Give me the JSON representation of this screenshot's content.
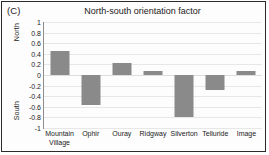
{
  "panel": {
    "label": "(C)"
  },
  "chart_data": {
    "type": "bar",
    "title": "North-south orientation factor",
    "xlabel": "",
    "ylabel": "",
    "categories": [
      "Mountain Village",
      "Ophir",
      "Ouray",
      "Ridgway",
      "Silverton",
      "Telluride",
      "Image"
    ],
    "values": [
      0.46,
      -0.57,
      0.23,
      0.08,
      -0.8,
      -0.28,
      0.07
    ],
    "ylim": [
      -1,
      1
    ],
    "yticks": [
      1,
      0.8,
      0.6,
      0.4,
      0.2,
      0,
      -0.2,
      -0.4,
      -0.6,
      -0.8,
      -1
    ],
    "ytick_labels": [
      "1",
      "0.8",
      "0.6",
      "0.4",
      "0.2",
      "0",
      "-0.2",
      "-0.4",
      "-0.6",
      "-0.8",
      "-1"
    ],
    "axis_direction_labels": {
      "positive": "North",
      "negative": "South"
    },
    "grid": true,
    "legend": "none",
    "bar_color": "#8a8a8a",
    "grid_color": "#e7e7e7",
    "axis_color": "#8d8d8d",
    "text_color": "#1b1b1b"
  }
}
